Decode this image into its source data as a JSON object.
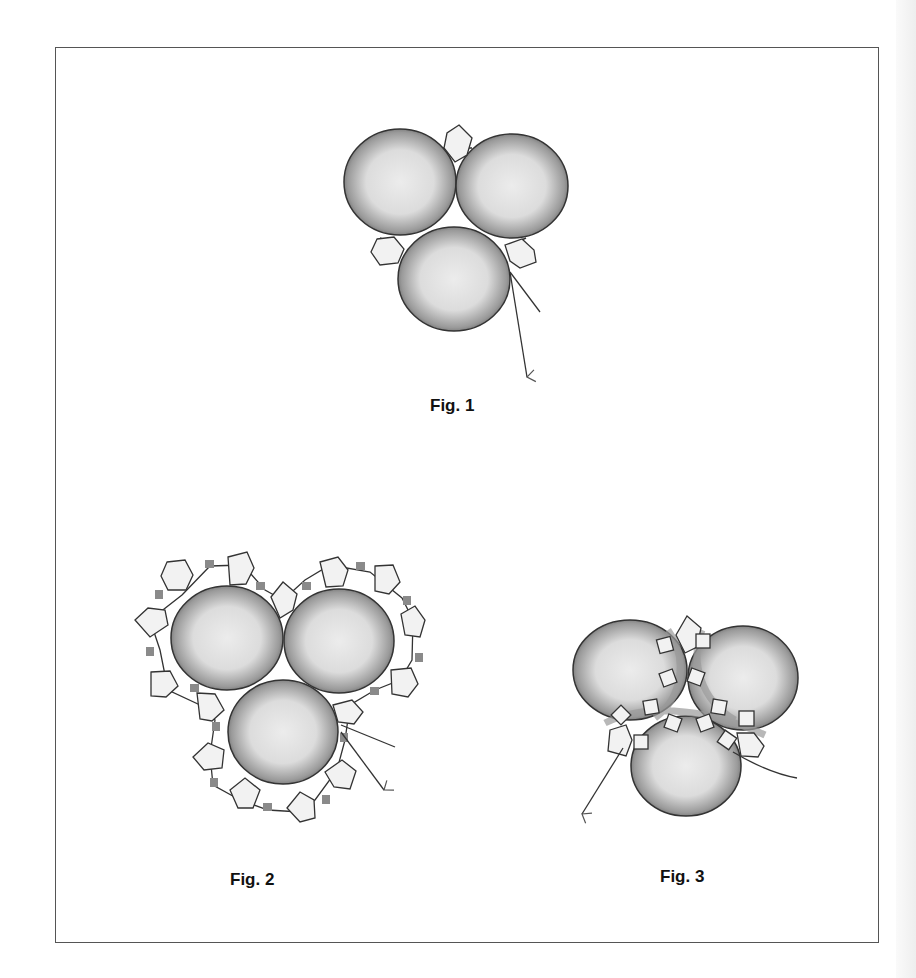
{
  "figures": [
    {
      "id": "fig1",
      "caption": "Fig. 1",
      "description": "Three large round beads joined with three hexagonal accent beads, thread exiting with arrow"
    },
    {
      "id": "fig2",
      "caption": "Fig. 2",
      "description": "Three large round beads surrounded by a ring of pentagonal beads alternating with small square seed beads"
    },
    {
      "id": "fig3",
      "caption": "Fig. 3",
      "description": "Three large round beads with square beads woven through the center, thread paths exiting with arrows"
    }
  ],
  "colors": {
    "bead_dark": "#6a6a6a",
    "bead_light": "#e4e4e4",
    "accent_bead": "#f0f0f0",
    "seed_bead": "#8a8a8a",
    "outline": "#333333",
    "frame": "#555555"
  }
}
